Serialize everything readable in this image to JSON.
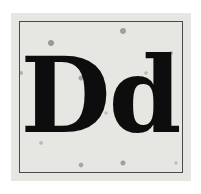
{
  "card": {
    "uppercase": "D",
    "lowercase": "d",
    "colors": {
      "paper": "#e6e6e3",
      "ink": "#0d0d0d",
      "frame": "#4a4a4a"
    }
  }
}
